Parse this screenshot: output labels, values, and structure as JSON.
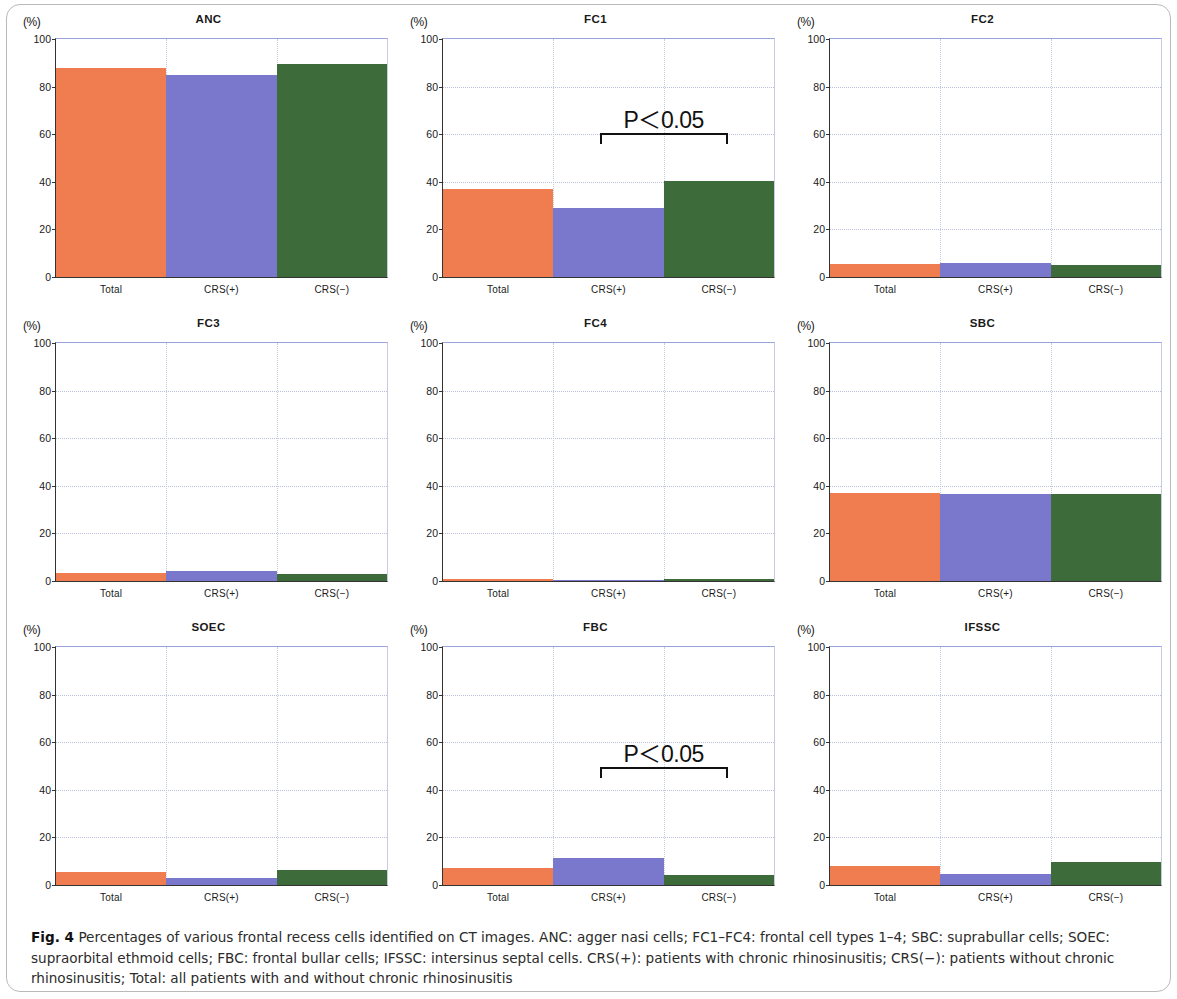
{
  "figure": {
    "label": "Fig. 4",
    "caption": "Percentages of various frontal recess cells identified on CT images. ANC: agger nasi cells; FC1–FC4: frontal cell types 1–4; SBC: suprabullar cells; SOEC: supraorbital ethmoid cells; FBC: frontal bullar cells; IFSSC: intersinus septal cells. CRS(+): patients with chronic rhinosinusitis; CRS(−): patients without chronic rhinosinusitis; Total: all patients with and without chronic rhinosinusitis"
  },
  "axis": {
    "unit_label": "(%)",
    "y_ticks": [
      "100",
      "80",
      "60",
      "40",
      "20",
      "0"
    ],
    "y_tick_values": [
      100,
      80,
      60,
      40,
      20,
      0
    ]
  },
  "colors": {
    "total": "#f07d50",
    "crs_positive": "#7a78cc",
    "crs_negative": "#3d6b3a",
    "gridline": "#b9bedd",
    "axis": "#333333"
  },
  "chart_data": [
    {
      "type": "bar",
      "title": "ANC",
      "categories": [
        "Total",
        "CRS(+)",
        "CRS(−)"
      ],
      "values": [
        88,
        85,
        89.5
      ],
      "xlabel": "",
      "ylabel": "(%)",
      "ylim": [
        0,
        100
      ],
      "grid": true,
      "annotation": null
    },
    {
      "type": "bar",
      "title": "FC1",
      "categories": [
        "Total",
        "CRS(+)",
        "CRS(−)"
      ],
      "values": [
        37,
        29,
        40.5
      ],
      "xlabel": "",
      "ylabel": "(%)",
      "ylim": [
        0,
        100
      ],
      "grid": true,
      "annotation": {
        "text": "P＜0.05",
        "from_category": "CRS(+)",
        "to_category": "CRS(−)",
        "y": 59
      }
    },
    {
      "type": "bar",
      "title": "FC2",
      "categories": [
        "Total",
        "CRS(+)",
        "CRS(−)"
      ],
      "values": [
        5.5,
        6,
        5
      ],
      "xlabel": "",
      "ylabel": "(%)",
      "ylim": [
        0,
        100
      ],
      "grid": true,
      "annotation": null
    },
    {
      "type": "bar",
      "title": "FC3",
      "categories": [
        "Total",
        "CRS(+)",
        "CRS(−)"
      ],
      "values": [
        3.5,
        4,
        3
      ],
      "xlabel": "",
      "ylabel": "(%)",
      "ylim": [
        0,
        100
      ],
      "grid": true,
      "annotation": null
    },
    {
      "type": "bar",
      "title": "FC4",
      "categories": [
        "Total",
        "CRS(+)",
        "CRS(−)"
      ],
      "values": [
        1,
        0.5,
        1
      ],
      "xlabel": "",
      "ylabel": "(%)",
      "ylim": [
        0,
        100
      ],
      "grid": true,
      "annotation": null
    },
    {
      "type": "bar",
      "title": "SBC",
      "categories": [
        "Total",
        "CRS(+)",
        "CRS(−)"
      ],
      "values": [
        37,
        36.5,
        36.5
      ],
      "xlabel": "",
      "ylabel": "(%)",
      "ylim": [
        0,
        100
      ],
      "grid": true,
      "annotation": null
    },
    {
      "type": "bar",
      "title": "SOEC",
      "categories": [
        "Total",
        "CRS(+)",
        "CRS(−)"
      ],
      "values": [
        5.5,
        3,
        6.5
      ],
      "xlabel": "",
      "ylabel": "(%)",
      "ylim": [
        0,
        100
      ],
      "grid": true,
      "annotation": null
    },
    {
      "type": "bar",
      "title": "FBC",
      "categories": [
        "Total",
        "CRS(+)",
        "CRS(−)"
      ],
      "values": [
        7,
        11.5,
        4
      ],
      "xlabel": "",
      "ylabel": "(%)",
      "ylim": [
        0,
        100
      ],
      "grid": true,
      "annotation": {
        "text": "P＜0.05",
        "from_category": "CRS(+)",
        "to_category": "CRS(−)",
        "y": 48
      }
    },
    {
      "type": "bar",
      "title": "IFSSC",
      "categories": [
        "Total",
        "CRS(+)",
        "CRS(−)"
      ],
      "values": [
        8,
        4.5,
        9.5
      ],
      "xlabel": "",
      "ylabel": "(%)",
      "ylim": [
        0,
        100
      ],
      "grid": true,
      "annotation": null
    }
  ]
}
